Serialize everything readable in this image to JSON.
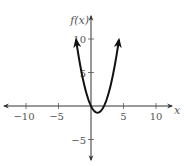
{
  "chart_data": {
    "type": "line",
    "title": "",
    "xlabel": "x",
    "ylabel": "f(x)",
    "function": "x^2 - 2x",
    "xlim": [
      -12,
      12
    ],
    "ylim": [
      -7,
      12
    ],
    "grid": false,
    "legend": null,
    "x_ticks": [
      -10,
      -5,
      5,
      10
    ],
    "y_ticks": [
      10,
      5,
      -5
    ],
    "x_tick_labels": [
      "−10",
      "−5",
      "5",
      "10"
    ],
    "y_tick_labels": [
      "10",
      "5",
      "−5"
    ],
    "series": [
      {
        "name": "f(x)",
        "x": [
          -2.3,
          -2,
          -1,
          0,
          1,
          2,
          3,
          4,
          4.3
        ],
        "y": [
          9.89,
          8,
          3,
          0,
          -1,
          0,
          3,
          8,
          9.89
        ],
        "arrows_at_ends": true
      }
    ],
    "key_points": {
      "vertex": [
        1,
        -1
      ],
      "roots": [
        0,
        2
      ]
    }
  },
  "axes": {
    "x_label": "x",
    "y_label": "f(x)"
  },
  "colors": {
    "curve": "#111111",
    "axis": "#333333",
    "text": "#555555"
  }
}
